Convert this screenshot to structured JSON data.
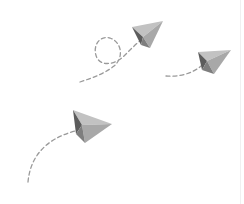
{
  "illustration": {
    "subject": "paper planes with dashed flight trails",
    "plane_count": 3,
    "colors": {
      "background": "#ffffff",
      "plane_light": "#bdbdbd",
      "plane_mid": "#929292",
      "plane_dark": "#5c5c5c",
      "trail": "#9a9a9a",
      "edge_line": "#f0f0f0"
    },
    "planes": [
      {
        "name": "top-plane",
        "trail_style": "loop"
      },
      {
        "name": "right-plane",
        "trail_style": "straight"
      },
      {
        "name": "bottom-left-plane",
        "trail_style": "arc"
      }
    ]
  }
}
